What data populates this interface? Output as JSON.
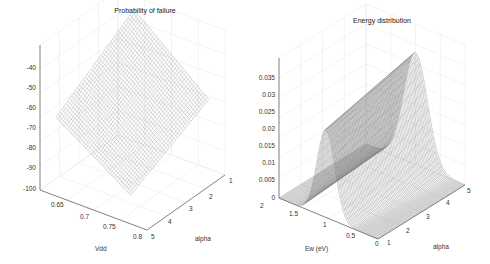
{
  "chart_data": [
    {
      "type": "surface3d",
      "title": "Probability of failure",
      "xlabel": "Vdd",
      "ylabel": "alpha",
      "zlabel": "",
      "x_ticks": [
        "0.65",
        "0.7",
        "0.75",
        "0.8"
      ],
      "y_ticks": [
        "1",
        "2",
        "3",
        "4",
        "5"
      ],
      "z_ticks": [
        "-40",
        "-50",
        "-60",
        "-70",
        "-80",
        "-90",
        "-100"
      ],
      "xlim": [
        0.6,
        0.8
      ],
      "ylim": [
        1,
        5
      ],
      "zlim": [
        -100,
        -35
      ],
      "grid": true,
      "description": "Wireframe mesh surface; log-probability of failure decreasing from about -35 at low Vdd / high alpha to about -100 at high Vdd / low alpha"
    },
    {
      "type": "surface3d",
      "title": "Energy distribution",
      "xlabel": "Ew (eV)",
      "ylabel": "alpha",
      "zlabel": "",
      "x_ticks": [
        "0",
        "0.5",
        "1",
        "1.5",
        "2"
      ],
      "y_ticks": [
        "1",
        "2",
        "3",
        "4",
        "5"
      ],
      "z_ticks": [
        "0",
        "0.005",
        "0.01",
        "0.015",
        "0.02",
        "0.025",
        "0.03",
        "0.035"
      ],
      "xlim": [
        0,
        2
      ],
      "ylim": [
        1,
        5
      ],
      "zlim": [
        0,
        0.035
      ],
      "grid": true,
      "description": "Dense mesh surface showing a ridge-shaped peak in energy near Ew ~ 1 eV; peak height ~0.022 at alpha=1 rising to ~0.028 at alpha=5"
    }
  ],
  "left": {
    "title": "Probability of failure",
    "z_ticks": [
      "-40",
      "-50",
      "-60",
      "-70",
      "-80",
      "-90",
      "-100"
    ],
    "x_ticks": [
      "0.65",
      "0.7",
      "0.75",
      "0.8"
    ],
    "y_ticks": [
      "1",
      "2",
      "3",
      "4",
      "5"
    ],
    "xlabel": "Vdd",
    "ylabel": "alpha"
  },
  "right": {
    "title": "Energy distribution",
    "z_ticks": [
      "0.035",
      "0.03",
      "0.025",
      "0.02",
      "0.015",
      "0.01",
      "0.005",
      "0"
    ],
    "x_ticks": [
      "2",
      "1.5",
      "1",
      "0.5",
      "0"
    ],
    "y_ticks": [
      "1",
      "2",
      "3",
      "4",
      "5"
    ],
    "xlabel": "Ew (eV)",
    "ylabel": "alpha"
  }
}
